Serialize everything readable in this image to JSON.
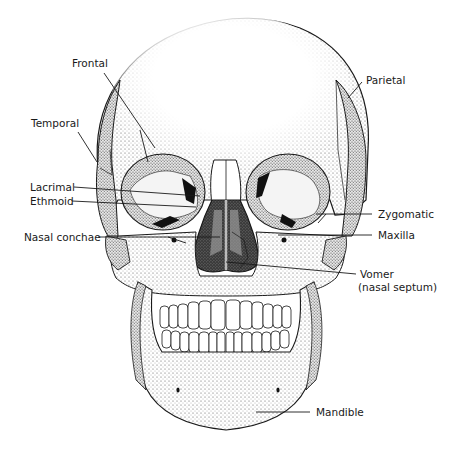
{
  "figure": {
    "labels": {
      "frontal": "Frontal",
      "parietal": "Parietal",
      "temporal": "Temporal",
      "lacrimal": "Lacrimal",
      "ethmoid": "Ethmoid",
      "nasal_conchae": "Nasal conchae",
      "zygomatic": "Zygomatic",
      "maxilla": "Maxilla",
      "vomer_line1": "Vomer",
      "vomer_line2": "(nasal septum)",
      "mandible": "Mandible"
    },
    "colors": {
      "ink": "#1a1a1a",
      "bone": "#ffffff",
      "shade": "#cfcfcf",
      "cavity": "#2a2a2a",
      "background": "#ffffff"
    }
  }
}
